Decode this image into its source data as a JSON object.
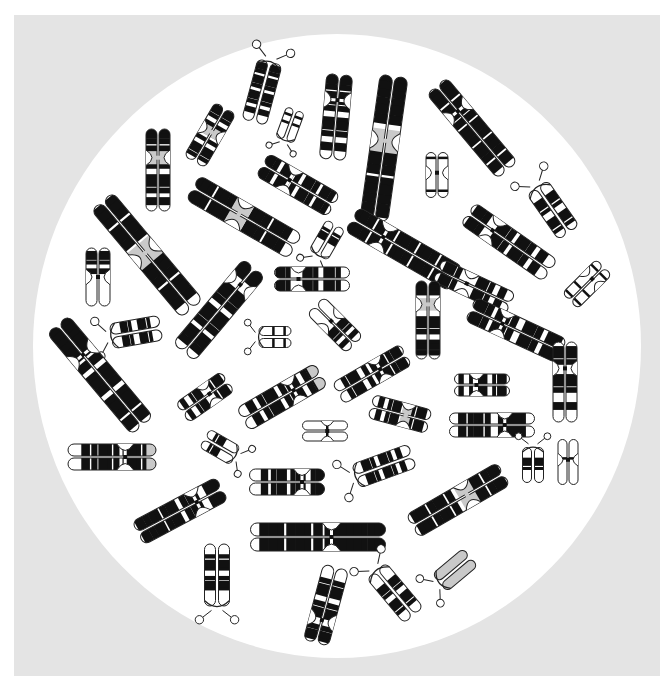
{
  "figure": {
    "colors": {
      "page": "#ffffff",
      "panel": "#e4e4e4",
      "field": "#ffffff",
      "band_dark": "#111111",
      "band_light": "#ffffff",
      "outline": "#222222",
      "centromere_gray": "#c9c9c9"
    },
    "field_ellipse": {
      "cx": 337,
      "cy": 346,
      "rx": 304,
      "ry": 312
    }
  },
  "chromosomes": [
    {
      "id": 1,
      "cx": 262,
      "cy": 92,
      "angle": 15,
      "len": 62,
      "w": 11,
      "p": 0.95,
      "bands": [
        0.08,
        0.18,
        0.3,
        0.42,
        0.55,
        0.68,
        0.82
      ],
      "sat": true,
      "gray": false,
      "outline": false,
      "acro": true
    },
    {
      "id": 2,
      "cx": 290,
      "cy": 125,
      "angle": -160,
      "len": 32,
      "w": 8,
      "p": 0.3,
      "bands": [
        0.55,
        0.8
      ],
      "sat": true,
      "gray": false,
      "outline": true,
      "acro": true
    },
    {
      "id": 3,
      "cx": 210,
      "cy": 135,
      "angle": 30,
      "len": 62,
      "w": 11,
      "p": 0.45,
      "bands": [
        0.06,
        0.2,
        0.35,
        0.6,
        0.75,
        0.9
      ],
      "sat": false,
      "gray": true,
      "outline": false,
      "acro": false
    },
    {
      "id": 4,
      "cx": 158,
      "cy": 170,
      "angle": 0,
      "len": 82,
      "w": 11,
      "p": 0.35,
      "bands": [
        0.05,
        0.15,
        0.25,
        0.45,
        0.6,
        0.75,
        0.88
      ],
      "sat": false,
      "gray": true,
      "outline": false,
      "acro": false
    },
    {
      "id": 5,
      "cx": 336,
      "cy": 117,
      "angle": 5,
      "len": 85,
      "w": 12,
      "p": 0.3,
      "bands": [
        0.05,
        0.15,
        0.25,
        0.4,
        0.55,
        0.7,
        0.85
      ],
      "sat": false,
      "gray": false,
      "outline": false,
      "acro": false
    },
    {
      "id": 6,
      "cx": 384,
      "cy": 148,
      "angle": 8,
      "len": 145,
      "w": 13,
      "p": 0.45,
      "bands": [
        0.04,
        0.12,
        0.2,
        0.3,
        0.55,
        0.65,
        0.75,
        0.85,
        0.93
      ],
      "sat": false,
      "gray": true,
      "outline": false,
      "acro": false
    },
    {
      "id": 7,
      "cx": 472,
      "cy": 128,
      "angle": -40,
      "len": 110,
      "w": 12,
      "p": 0.3,
      "bands": [
        0.06,
        0.15,
        0.25,
        0.4,
        0.5,
        0.6,
        0.7,
        0.8,
        0.9
      ],
      "sat": false,
      "gray": false,
      "outline": false,
      "acro": false
    },
    {
      "id": 8,
      "cx": 437,
      "cy": 175,
      "angle": 0,
      "len": 45,
      "w": 10,
      "p": 0.45,
      "bands": [
        0.12,
        0.85
      ],
      "sat": false,
      "gray": false,
      "outline": true,
      "acro": false
    },
    {
      "id": 9,
      "cx": 298,
      "cy": 185,
      "angle": -60,
      "len": 82,
      "w": 12,
      "p": 0.38,
      "bands": [
        0.05,
        0.15,
        0.28,
        0.45,
        0.58,
        0.7,
        0.82,
        0.92
      ],
      "sat": false,
      "gray": false,
      "outline": false,
      "acro": false
    },
    {
      "id": 10,
      "cx": 244,
      "cy": 217,
      "angle": -60,
      "len": 118,
      "w": 13,
      "p": 0.45,
      "bands": [
        0.05,
        0.14,
        0.24,
        0.34,
        0.58,
        0.68,
        0.78,
        0.88
      ],
      "sat": false,
      "gray": true,
      "outline": false,
      "acro": false
    },
    {
      "id": 11,
      "cx": 553,
      "cy": 210,
      "angle": -35,
      "len": 55,
      "w": 11,
      "p": 0.1,
      "bands": [
        0.25,
        0.45,
        0.65,
        0.85
      ],
      "sat": true,
      "gray": false,
      "outline": false,
      "acro": true
    },
    {
      "id": 12,
      "cx": 147,
      "cy": 255,
      "angle": -40,
      "len": 140,
      "w": 13,
      "p": 0.48,
      "bands": [
        0.06,
        0.15,
        0.25,
        0.35,
        0.6,
        0.7,
        0.8,
        0.9
      ],
      "sat": false,
      "gray": true,
      "outline": false,
      "acro": false
    },
    {
      "id": 13,
      "cx": 98,
      "cy": 277,
      "angle": 0,
      "len": 58,
      "w": 11,
      "p": 0.5,
      "bands": [
        0.1,
        0.25,
        0.4
      ],
      "sat": false,
      "gray": false,
      "outline": false,
      "acro": false,
      "qwhite": true
    },
    {
      "id": 14,
      "cx": 327,
      "cy": 240,
      "angle": -150,
      "len": 35,
      "w": 9,
      "p": 0.25,
      "bands": [
        0.5,
        0.75
      ],
      "sat": true,
      "gray": false,
      "outline": false,
      "acro": true
    },
    {
      "id": 15,
      "cx": 404,
      "cy": 249,
      "angle": -60,
      "len": 120,
      "w": 13,
      "p": 0.3,
      "bands": [
        0.05,
        0.15,
        0.25,
        0.35,
        0.45,
        0.55,
        0.65,
        0.75,
        0.85,
        0.93
      ],
      "sat": false,
      "gray": false,
      "outline": false,
      "acro": false
    },
    {
      "id": 16,
      "cx": 509,
      "cy": 242,
      "angle": -55,
      "len": 100,
      "w": 12,
      "p": 0.3,
      "bands": [
        0.08,
        0.18,
        0.35,
        0.48,
        0.6,
        0.72,
        0.85
      ],
      "sat": false,
      "gray": false,
      "outline": false,
      "acro": false
    },
    {
      "id": 17,
      "cx": 587,
      "cy": 284,
      "angle": 45,
      "len": 48,
      "w": 10,
      "p": 0.35,
      "bands": [
        0.15,
        0.65,
        0.9
      ],
      "sat": false,
      "gray": false,
      "outline": true,
      "acro": false
    },
    {
      "id": 18,
      "cx": 312,
      "cy": 279,
      "angle": -90,
      "len": 75,
      "w": 11,
      "p": 0.32,
      "bands": [
        0.06,
        0.18,
        0.42,
        0.55,
        0.7,
        0.85
      ],
      "sat": false,
      "gray": false,
      "outline": false,
      "acro": false
    },
    {
      "id": 19,
      "cx": 219,
      "cy": 310,
      "angle": 40,
      "len": 110,
      "w": 13,
      "p": 0.2,
      "bands": [
        0.05,
        0.12,
        0.3,
        0.42,
        0.55,
        0.68,
        0.8,
        0.9
      ],
      "sat": false,
      "gray": false,
      "outline": false,
      "acro": false
    },
    {
      "id": 20,
      "cx": 474,
      "cy": 287,
      "angle": -65,
      "len": 80,
      "w": 11,
      "p": 0.4,
      "bands": [
        0.1,
        0.25,
        0.55,
        0.7,
        0.85
      ],
      "sat": false,
      "gray": false,
      "outline": false,
      "acro": false
    },
    {
      "id": 21,
      "cx": 428,
      "cy": 320,
      "angle": 0,
      "len": 78,
      "w": 11,
      "p": 0.3,
      "bands": [
        0.05,
        0.15,
        0.5,
        0.65,
        0.8,
        0.92
      ],
      "sat": false,
      "gray": true,
      "outline": false,
      "acro": false
    },
    {
      "id": 22,
      "cx": 136,
      "cy": 332,
      "angle": -100,
      "len": 50,
      "w": 11,
      "p": 0.12,
      "bands": [
        0.25,
        0.4,
        0.6,
        0.78
      ],
      "sat": true,
      "gray": false,
      "outline": false,
      "acro": true
    },
    {
      "id": 23,
      "cx": 275,
      "cy": 337,
      "angle": -90,
      "len": 32,
      "w": 9,
      "p": 0.22,
      "bands": [
        0.45,
        0.8
      ],
      "sat": true,
      "gray": false,
      "outline": true,
      "acro": true
    },
    {
      "id": 24,
      "cx": 335,
      "cy": 325,
      "angle": -45,
      "len": 55,
      "w": 11,
      "p": 0.4,
      "bands": [
        0.55,
        0.7,
        0.85
      ],
      "sat": false,
      "gray": false,
      "outline": false,
      "acro": false,
      "pwhite": true
    },
    {
      "id": 25,
      "cx": 516,
      "cy": 330,
      "angle": -65,
      "len": 100,
      "w": 12,
      "p": 0.35,
      "bands": [
        0.06,
        0.18,
        0.3,
        0.45,
        0.6,
        0.72,
        0.85,
        0.93
      ],
      "sat": false,
      "gray": false,
      "outline": false,
      "acro": false
    },
    {
      "id": 26,
      "cx": 100,
      "cy": 375,
      "angle": -40,
      "len": 132,
      "w": 13,
      "p": 0.3,
      "bands": [
        0.05,
        0.13,
        0.2,
        0.38,
        0.5,
        0.6,
        0.72,
        0.82,
        0.92
      ],
      "sat": false,
      "gray": false,
      "outline": false,
      "acro": false
    },
    {
      "id": 27,
      "cx": 565,
      "cy": 382,
      "angle": 0,
      "len": 80,
      "w": 11,
      "p": 0.33,
      "bands": [
        0.1,
        0.25,
        0.45,
        0.6,
        0.8
      ],
      "sat": false,
      "gray": false,
      "outline": false,
      "acro": false
    },
    {
      "id": 28,
      "cx": 205,
      "cy": 397,
      "angle": 55,
      "len": 55,
      "w": 11,
      "p": 0.4,
      "bands": [
        0.1,
        0.3,
        0.55,
        0.7,
        0.88
      ],
      "sat": false,
      "gray": false,
      "outline": false,
      "acro": false
    },
    {
      "id": 29,
      "cx": 282,
      "cy": 397,
      "angle": 60,
      "len": 90,
      "w": 12,
      "p": 0.35,
      "bands": [
        0.06,
        0.16,
        0.3,
        0.45,
        0.58,
        0.72,
        0.85
      ],
      "sat": false,
      "gray": false,
      "outline": false,
      "acro": false,
      "grayTip": true
    },
    {
      "id": 30,
      "cx": 372,
      "cy": 374,
      "angle": 60,
      "len": 78,
      "w": 11,
      "p": 0.38,
      "bands": [
        0.08,
        0.2,
        0.3,
        0.55,
        0.7,
        0.85
      ],
      "sat": false,
      "gray": false,
      "outline": false,
      "acro": false
    },
    {
      "id": 31,
      "cx": 482,
      "cy": 385,
      "angle": 90,
      "len": 55,
      "w": 10,
      "p": 0.6,
      "bands": [
        0.1,
        0.28,
        0.45,
        0.7,
        0.88
      ],
      "sat": false,
      "gray": false,
      "outline": false,
      "acro": false
    },
    {
      "id": 32,
      "cx": 400,
      "cy": 414,
      "angle": 105,
      "len": 60,
      "w": 11,
      "p": 0.4,
      "bands": [
        0.12,
        0.3,
        0.55,
        0.7,
        0.85
      ],
      "sat": false,
      "gray": true,
      "outline": false,
      "acro": false
    },
    {
      "id": 33,
      "cx": 492,
      "cy": 425,
      "angle": 90,
      "len": 85,
      "w": 11,
      "p": 0.35,
      "bands": [
        0.15,
        0.55,
        0.65,
        0.75,
        0.85
      ],
      "sat": false,
      "gray": false,
      "outline": false,
      "acro": false
    },
    {
      "id": 34,
      "cx": 325,
      "cy": 431,
      "angle": 90,
      "len": 45,
      "w": 9,
      "p": 0.45,
      "bands": [
        0.45
      ],
      "sat": false,
      "gray": false,
      "outline": true,
      "acro": false
    },
    {
      "id": 35,
      "cx": 220,
      "cy": 447,
      "angle": 120,
      "len": 35,
      "w": 9,
      "p": 0.2,
      "bands": [
        0.5,
        0.75
      ],
      "sat": true,
      "gray": false,
      "outline": false,
      "acro": true
    },
    {
      "id": 36,
      "cx": 112,
      "cy": 457,
      "angle": 90,
      "len": 88,
      "w": 12,
      "p": 0.35,
      "bands": [
        0.05,
        0.12,
        0.22,
        0.45,
        0.55,
        0.7,
        0.8
      ],
      "sat": false,
      "gray": false,
      "outline": false,
      "acro": false,
      "grayTip": true
    },
    {
      "id": 37,
      "cx": 533,
      "cy": 465,
      "angle": 0,
      "len": 35,
      "w": 9,
      "p": 0.15,
      "bands": [
        0.35,
        0.6
      ],
      "sat": true,
      "gray": false,
      "outline": false,
      "acro": true
    },
    {
      "id": 38,
      "cx": 568,
      "cy": 462,
      "angle": 0,
      "len": 45,
      "w": 9,
      "p": 0.45,
      "bands": [
        0.42
      ],
      "sat": false,
      "gray": false,
      "outline": true,
      "acro": false
    },
    {
      "id": 39,
      "cx": 384,
      "cy": 466,
      "angle": -110,
      "len": 60,
      "w": 11,
      "p": 0.12,
      "bands": [
        0.2,
        0.35,
        0.5,
        0.65,
        0.8
      ],
      "sat": true,
      "gray": false,
      "outline": false,
      "acro": true
    },
    {
      "id": 40,
      "cx": 287,
      "cy": 482,
      "angle": 90,
      "len": 75,
      "w": 12,
      "p": 0.3,
      "bands": [
        0.05,
        0.15,
        0.3,
        0.42,
        0.55,
        0.68,
        0.8
      ],
      "sat": false,
      "gray": false,
      "outline": false,
      "acro": false
    },
    {
      "id": 41,
      "cx": 458,
      "cy": 500,
      "angle": 60,
      "len": 105,
      "w": 12,
      "p": 0.4,
      "bands": [
        0.06,
        0.16,
        0.26,
        0.55,
        0.65,
        0.75,
        0.85,
        0.93
      ],
      "sat": false,
      "gray": true,
      "outline": false,
      "acro": false
    },
    {
      "id": 42,
      "cx": 180,
      "cy": 511,
      "angle": 62,
      "len": 95,
      "w": 12,
      "p": 0.3,
      "bands": [
        0.05,
        0.14,
        0.3,
        0.42,
        0.55,
        0.65,
        0.75,
        0.85,
        0.93
      ],
      "sat": false,
      "gray": false,
      "outline": false,
      "acro": false
    },
    {
      "id": 43,
      "cx": 318,
      "cy": 537,
      "angle": 90,
      "len": 135,
      "w": 13,
      "p": 0.4,
      "bands": [
        0.04,
        0.1,
        0.18,
        0.26,
        0.34,
        0.5,
        0.6,
        0.7,
        0.8,
        0.9
      ],
      "sat": false,
      "gray": false,
      "outline": false,
      "acro": false
    },
    {
      "id": 44,
      "cx": 217,
      "cy": 575,
      "angle": 180,
      "len": 62,
      "w": 11,
      "p": 0.12,
      "bands": [
        0.3,
        0.45,
        0.62,
        0.8
      ],
      "sat": true,
      "gray": false,
      "outline": false,
      "acro": true
    },
    {
      "id": 45,
      "cx": 455,
      "cy": 570,
      "angle": -130,
      "len": 40,
      "w": 10,
      "p": 0.3,
      "bands": [],
      "sat": true,
      "gray": false,
      "outline": true,
      "acro": true,
      "allGray": true
    },
    {
      "id": 46,
      "cx": 326,
      "cy": 605,
      "angle": 195,
      "len": 78,
      "w": 12,
      "p": 0.3,
      "bands": [
        0.08,
        0.2,
        0.35,
        0.5,
        0.65,
        0.8
      ],
      "sat": false,
      "gray": false,
      "outline": false,
      "acro": false
    },
    {
      "id": 47,
      "cx": 395,
      "cy": 593,
      "angle": -40,
      "len": 58,
      "w": 11,
      "p": 0.12,
      "bands": [
        0.3,
        0.45,
        0.62,
        0.8
      ],
      "sat": true,
      "gray": false,
      "outline": false,
      "acro": true
    }
  ]
}
